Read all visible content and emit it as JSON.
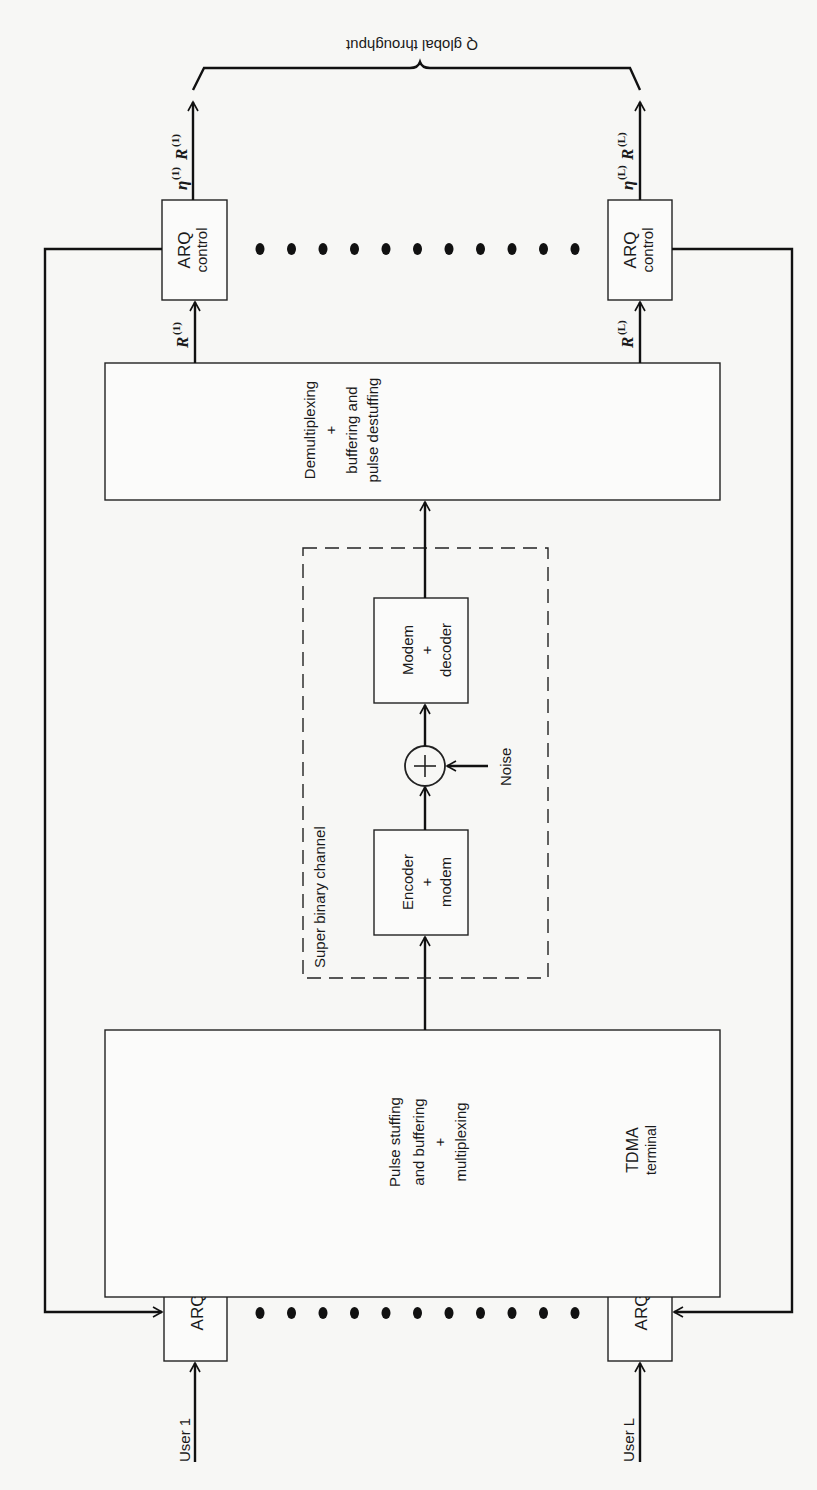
{
  "diagram": {
    "users": [
      {
        "label": "User 1",
        "arq_label": "ARQ",
        "rate_symbol": "R",
        "rate_index": "(1)",
        "arq_control_label_1": "ARQ",
        "arq_control_label_2": "control",
        "output_eta": "η",
        "output_index": "(1)",
        "output_rate": "R",
        "output_rate_index": "(1)"
      },
      {
        "label": "User L",
        "arq_label": "ARQ",
        "rate_symbol": "R",
        "rate_index": "(L)",
        "arq_control_label_1": "ARQ",
        "arq_control_label_2": "control",
        "output_eta": "η",
        "output_index": "(L)",
        "output_rate": "R",
        "output_rate_index": "(L)"
      }
    ],
    "mux_block": {
      "lines": [
        "Pulse stuffing",
        "and buffering",
        "+",
        "multiplexing"
      ],
      "sublabel_1": "TDMA",
      "sublabel_2": "terminal"
    },
    "channel": {
      "label": "Super binary channel",
      "encoder_lines": [
        "Encoder",
        "+",
        "modem"
      ],
      "decoder_lines": [
        "Modem",
        "+",
        "decoder"
      ],
      "sum_symbol": "+",
      "noise_label": "Noise"
    },
    "demux_block": {
      "lines": [
        "Demultiplexing",
        "+",
        "buffering and",
        "pulse destuffing"
      ]
    },
    "throughput_label": "Q global throughput",
    "ellipsis_dot_count": 11
  }
}
